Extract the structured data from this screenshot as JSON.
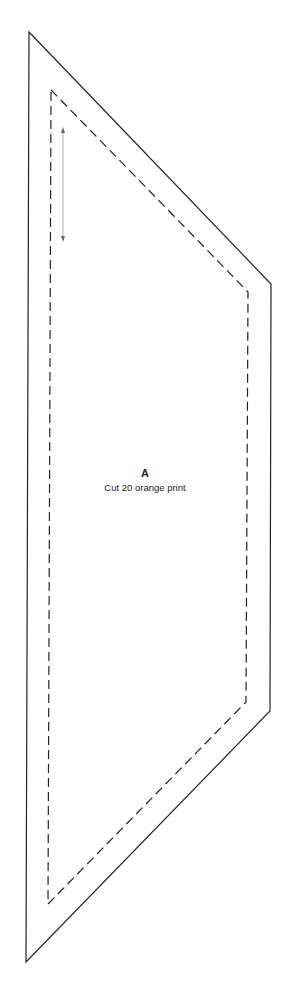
{
  "pattern": {
    "piece_letter": "A",
    "instruction": "Cut 20 orange print",
    "cut_line": {
      "style": "solid",
      "color": "#222222",
      "points": [
        [
          29,
          32
        ],
        [
          271,
          284
        ],
        [
          270,
          711
        ],
        [
          26,
          962
        ]
      ]
    },
    "seam_line": {
      "style": "dashed",
      "color": "#222222",
      "points": [
        [
          51,
          90
        ],
        [
          248,
          292
        ],
        [
          246,
          702
        ],
        [
          48,
          904
        ]
      ]
    },
    "grain_arrow": {
      "color": "#999999",
      "x": 63,
      "y_start": 128,
      "y_end": 241
    }
  }
}
